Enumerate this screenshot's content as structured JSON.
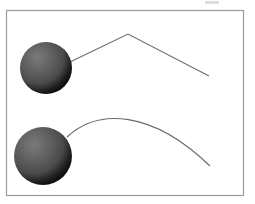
{
  "canvas": {
    "width": 255,
    "height": 204,
    "background_color": "#ffffff",
    "page_background_color": "#ffffff"
  },
  "frame": {
    "name": "figure-border",
    "x": 6,
    "y": 10,
    "width": 238,
    "height": 186,
    "stroke_color": "#9a9a9a",
    "stroke_width": 1.2,
    "fill_color": "#ffffff"
  },
  "artifact": {
    "name": "top-smudge",
    "x": 205,
    "y": 1,
    "width": 14,
    "height": 3,
    "color": "#d8d8d8"
  },
  "spheres": [
    {
      "id": "upper-sphere",
      "label": "upper-sphere",
      "cx": 46,
      "cy": 68,
      "r": 26,
      "highlight_color": "#7a7a7a",
      "mid_color": "#4a4a4a",
      "shadow_color": "#101010",
      "highlight_offset_x": "34%",
      "highlight_offset_y": "30%"
    },
    {
      "id": "lower-sphere",
      "label": "lower-sphere",
      "cx": 43,
      "cy": 156,
      "r": 29,
      "highlight_color": "#7a7a7a",
      "mid_color": "#4a4a4a",
      "shadow_color": "#101010",
      "highlight_offset_x": "34%",
      "highlight_offset_y": "30%"
    }
  ],
  "paths": [
    {
      "id": "upper-polyline",
      "label": "upper-trajectory-polyline",
      "type": "polyline",
      "stroke_color": "#6b6b6b",
      "stroke_width": 1.1,
      "points": [
        [
          70,
          62
        ],
        [
          128,
          34
        ],
        [
          209,
          76
        ]
      ]
    },
    {
      "id": "lower-arc",
      "label": "lower-trajectory-arc",
      "type": "curve",
      "stroke_color": "#6b6b6b",
      "stroke_width": 1.1,
      "start": [
        67,
        137
      ],
      "control_1": [
        98,
        108
      ],
      "control_2": [
        152,
        110
      ],
      "end": [
        210,
        166
      ],
      "apex": [
        133,
        112
      ]
    }
  ],
  "chart_data": {
    "type": "line",
    "title": "",
    "xlabel": "",
    "ylabel": "",
    "xlim": [
      0,
      255
    ],
    "ylim": [
      204,
      0
    ],
    "grid": false,
    "legend": "none",
    "series": [
      {
        "name": "upper-trajectory",
        "style": "polyline",
        "x": [
          70,
          128,
          209
        ],
        "y": [
          62,
          34,
          76
        ]
      },
      {
        "name": "lower-trajectory",
        "style": "smooth-arc",
        "x": [
          67,
          100,
          133,
          170,
          210
        ],
        "y": [
          137,
          117,
          112,
          126,
          166
        ]
      }
    ],
    "markers": [
      {
        "name": "upper-sphere",
        "x": 46,
        "y": 68,
        "radius": 26
      },
      {
        "name": "lower-sphere",
        "x": 43,
        "y": 156,
        "radius": 29
      }
    ]
  }
}
